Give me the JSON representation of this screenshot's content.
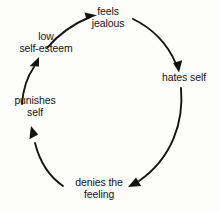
{
  "diagram": {
    "type": "cycle-diagram",
    "direction": "clockwise",
    "stroke_color": "#141414",
    "background_color": "#fdfdfc",
    "text_color": "#141414",
    "nodes": [
      {
        "id": "feels-jealous",
        "lines": [
          "feels",
          "jealous"
        ]
      },
      {
        "id": "hates-self",
        "lines": [
          "hates self"
        ]
      },
      {
        "id": "denies-feeling",
        "lines": [
          "denies the",
          "feeling"
        ]
      },
      {
        "id": "punishes-self",
        "lines": [
          "punishes",
          "self"
        ]
      },
      {
        "id": "low-self-esteem",
        "lines": [
          "low",
          "self-esteem"
        ]
      }
    ],
    "edges": [
      {
        "from": "low-self-esteem",
        "to": "feels-jealous",
        "arrow": "right"
      },
      {
        "from": "feels-jealous",
        "to": "hates-self",
        "arrow": "down"
      },
      {
        "from": "hates-self",
        "to": "denies-feeling",
        "arrow": "down-left"
      },
      {
        "from": "denies-feeling",
        "to": "punishes-self",
        "arrow": "up-left"
      },
      {
        "from": "punishes-self",
        "to": "low-self-esteem",
        "arrow": "up"
      }
    ]
  }
}
